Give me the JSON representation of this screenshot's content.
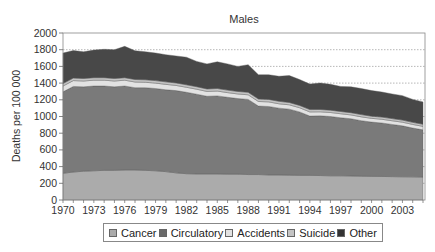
{
  "chart_data": {
    "type": "area",
    "stacked": true,
    "title": "Males",
    "xlabel": "",
    "ylabel": "Deaths per 100 000",
    "ylim": [
      0,
      2000
    ],
    "yticks": [
      0,
      200,
      400,
      600,
      800,
      1000,
      1200,
      1400,
      1600,
      1800,
      2000
    ],
    "ytick_labels": [
      "0",
      "200",
      "400",
      "600",
      "800",
      "1000",
      "1200",
      "1400",
      "1600",
      "1800",
      "2000"
    ],
    "xticks": [
      1970,
      1973,
      1976,
      1979,
      1982,
      1985,
      1988,
      1991,
      1994,
      1997,
      2000,
      2003
    ],
    "xtick_labels": [
      "1970",
      "1973",
      "1976",
      "1979",
      "1982",
      "1985",
      "1988",
      "1991",
      "1994",
      "1997",
      "2000",
      "2003"
    ],
    "grid": "horizontal dotted",
    "legend_position": "bottom",
    "x": [
      1970,
      1971,
      1972,
      1973,
      1974,
      1975,
      1976,
      1977,
      1978,
      1979,
      1980,
      1981,
      1982,
      1983,
      1984,
      1985,
      1986,
      1987,
      1988,
      1989,
      1990,
      1991,
      1992,
      1993,
      1994,
      1995,
      1996,
      1997,
      1998,
      1999,
      2000,
      2001,
      2002,
      2003,
      2004,
      2005
    ],
    "series": [
      {
        "name": "Cancer",
        "color": "#ababab",
        "values": [
          320,
          335,
          345,
          350,
          355,
          355,
          360,
          360,
          355,
          350,
          340,
          325,
          315,
          312,
          312,
          312,
          310,
          310,
          305,
          305,
          300,
          300,
          298,
          295,
          295,
          293,
          290,
          290,
          288,
          285,
          283,
          282,
          280,
          278,
          277,
          275
        ]
      },
      {
        "name": "Circulatory",
        "color": "#7a7a7a",
        "values": [
          975,
          1025,
          1010,
          1015,
          1010,
          1000,
          1005,
          985,
          990,
          985,
          980,
          985,
          975,
          955,
          930,
          935,
          920,
          905,
          900,
          820,
          820,
          800,
          790,
          760,
          710,
          715,
          710,
          695,
          685,
          665,
          650,
          640,
          625,
          610,
          585,
          565
        ]
      },
      {
        "name": "Accidents",
        "color": "#e2e2e2",
        "values": [
          70,
          70,
          70,
          70,
          70,
          70,
          70,
          68,
          65,
          65,
          65,
          62,
          60,
          60,
          58,
          58,
          56,
          55,
          55,
          55,
          55,
          52,
          52,
          50,
          50,
          48,
          48,
          48,
          46,
          46,
          45,
          45,
          44,
          44,
          43,
          42
        ]
      },
      {
        "name": "Suicide",
        "color": "#c4c4c4",
        "values": [
          30,
          30,
          30,
          30,
          30,
          30,
          30,
          30,
          30,
          30,
          30,
          30,
          30,
          30,
          30,
          30,
          30,
          30,
          30,
          30,
          30,
          30,
          28,
          28,
          28,
          28,
          28,
          27,
          27,
          27,
          26,
          26,
          26,
          25,
          25,
          25
        ]
      },
      {
        "name": "Other",
        "color": "#484848",
        "values": [
          365,
          330,
          320,
          330,
          340,
          345,
          375,
          345,
          335,
          330,
          325,
          323,
          330,
          303,
          300,
          320,
          314,
          300,
          330,
          290,
          295,
          300,
          322,
          310,
          305,
          317,
          309,
          300,
          309,
          312,
          306,
          300,
          295,
          293,
          275,
          268
        ]
      }
    ]
  },
  "legend": {
    "items": [
      {
        "label": "Cancer",
        "color": "#ababab"
      },
      {
        "label": "Circulatory",
        "color": "#6a6a6a"
      },
      {
        "label": "Accidents",
        "color": "#e2e2e2"
      },
      {
        "label": "Suicide",
        "color": "#c4c4c4"
      },
      {
        "label": "Other",
        "color": "#333333"
      }
    ]
  }
}
